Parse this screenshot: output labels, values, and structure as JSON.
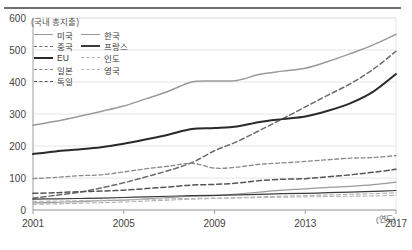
{
  "axis": {
    "y_title": "(국내 총지출)",
    "x_title": "(연도)",
    "y_ticks": [
      "0",
      "100",
      "200",
      "300",
      "400",
      "500",
      "600"
    ],
    "x_ticks": [
      "2001",
      "2005",
      "2009",
      "2013",
      "2017"
    ]
  },
  "legend": {
    "items": [
      {
        "label": "미국",
        "color": "#9a9a9a",
        "dash": "solid"
      },
      {
        "label": "한국",
        "color": "#9a9a9a",
        "dash": "solid"
      },
      {
        "label": "중국",
        "color": "#6b6b6b",
        "dash": "dashed"
      },
      {
        "label": "프랑스",
        "color": "#3a3a3a",
        "dash": "solid"
      },
      {
        "label": "EU",
        "color": "#2a2a2a",
        "dash": "solid"
      },
      {
        "label": "인도",
        "color": "#b0b0b0",
        "dash": "dashed"
      },
      {
        "label": "일본",
        "color": "#8a8a8a",
        "dash": "dashed"
      },
      {
        "label": "영국",
        "color": "#b8b8b8",
        "dash": "dashed"
      },
      {
        "label": "독일",
        "color": "#555555",
        "dash": "dashed"
      }
    ]
  },
  "chart_data": {
    "type": "line",
    "title": "",
    "xlabel": "(연도)",
    "ylabel": "(국내 총지출)",
    "xlim": [
      2001,
      2017
    ],
    "ylim": [
      0,
      600
    ],
    "grid": true,
    "legend_position": "top-left",
    "x": [
      2001,
      2002,
      2003,
      2004,
      2005,
      2006,
      2007,
      2008,
      2009,
      2010,
      2011,
      2012,
      2013,
      2014,
      2015,
      2016,
      2017
    ],
    "series": [
      {
        "name": "미국",
        "color": "#9a9a9a",
        "dash": "solid",
        "values": [
          265,
          277,
          292,
          308,
          325,
          348,
          372,
          400,
          403,
          405,
          424,
          434,
          443,
          464,
          489,
          516,
          549
        ]
      },
      {
        "name": "중국",
        "color": "#6b6b6b",
        "dash": "dashed",
        "values": [
          37,
          46,
          55,
          69,
          85,
          104,
          124,
          148,
          185,
          214,
          249,
          285,
          322,
          359,
          395,
          440,
          496
        ]
      },
      {
        "name": "EU",
        "color": "#2a2a2a",
        "dash": "solid",
        "values": [
          175,
          183,
          189,
          196,
          207,
          221,
          236,
          253,
          256,
          261,
          275,
          284,
          292,
          310,
          334,
          370,
          425
        ]
      },
      {
        "name": "일본",
        "color": "#8a8a8a",
        "dash": "dashed",
        "values": [
          98,
          102,
          107,
          110,
          119,
          129,
          137,
          146,
          131,
          134,
          143,
          147,
          152,
          157,
          162,
          164,
          170
        ]
      },
      {
        "name": "독일",
        "color": "#555555",
        "dash": "dashed",
        "values": [
          52,
          54,
          57,
          59,
          62,
          67,
          72,
          78,
          80,
          84,
          92,
          96,
          98,
          104,
          110,
          118,
          127
        ]
      },
      {
        "name": "한국",
        "color": "#9a9a9a",
        "dash": "solid",
        "values": [
          22,
          24,
          26,
          29,
          31,
          35,
          39,
          43,
          45,
          50,
          56,
          62,
          66,
          71,
          74,
          79,
          87
        ]
      },
      {
        "name": "프랑스",
        "color": "#3a3a3a",
        "dash": "solid",
        "values": [
          34,
          35,
          36,
          37,
          39,
          41,
          43,
          45,
          46,
          47,
          49,
          51,
          52,
          54,
          56,
          58,
          61
        ]
      },
      {
        "name": "인도",
        "color": "#b0b0b0",
        "dash": "dashed",
        "values": [
          18,
          19,
          21,
          23,
          25,
          28,
          31,
          34,
          36,
          38,
          41,
          43,
          45,
          47,
          49,
          51,
          54
        ]
      },
      {
        "name": "영국",
        "color": "#b8b8b8",
        "dash": "dashed",
        "values": [
          27,
          28,
          29,
          30,
          31,
          33,
          35,
          36,
          37,
          38,
          39,
          40,
          41,
          42,
          43,
          44,
          46
        ]
      }
    ]
  }
}
